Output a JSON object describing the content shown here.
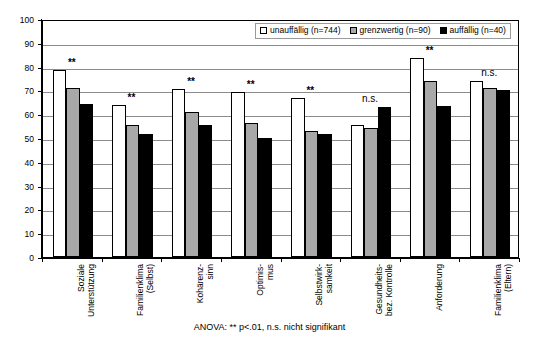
{
  "chart_data": {
    "type": "bar",
    "title": "",
    "subtitle": "",
    "xlabel": "",
    "ylabel": "",
    "ylim": [
      0,
      100
    ],
    "yticks": [
      0,
      10,
      20,
      30,
      40,
      50,
      60,
      70,
      80,
      90,
      100
    ],
    "grid": true,
    "legend_position": "top-right",
    "categories": [
      "Soziale\nUnterstützung",
      "Familienklima\n(Selbst)",
      "Kohärenz-\nsinn",
      "Optimis-\nmus",
      "Selbstwirk-\nsamkeit",
      "Gesundheits-\nbez. Kontrolle",
      "Anforderung",
      "Familienklima\n(Eltern)"
    ],
    "series": [
      {
        "name": "unauffällig (n=744)",
        "color": "#ffffff",
        "values": [
          78.5,
          64.0,
          70.5,
          69.5,
          67.0,
          55.5,
          83.5,
          74.0
        ]
      },
      {
        "name": "grenzwertig (n=90)",
        "color": "#a8a8a8",
        "values": [
          71.0,
          55.5,
          61.0,
          56.5,
          53.0,
          54.0,
          74.0,
          71.0
        ]
      },
      {
        "name": "auffällig (n=40)",
        "color": "#000000",
        "values": [
          64.5,
          51.5,
          55.5,
          50.0,
          51.5,
          63.0,
          63.5,
          70.0
        ]
      }
    ],
    "annotations": [
      "**",
      "**",
      "**",
      "**",
      "**",
      "n.s.",
      "**",
      "n.s."
    ],
    "footnote": "ANOVA: ** p<.01, n.s. nicht signifikant"
  },
  "legend": {
    "items": [
      {
        "label": "unauffällig (n=744)"
      },
      {
        "label": "grenzwertig (n=90)"
      },
      {
        "label": "auffällig (n=40)"
      }
    ]
  }
}
